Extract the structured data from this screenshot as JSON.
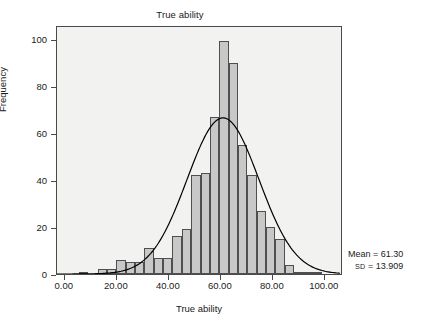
{
  "chart_data": {
    "type": "bar",
    "title": "True ability",
    "xlabel": "True ability",
    "ylabel": "Frequency",
    "subtype": "histogram-with-normal-curve",
    "xlim": [
      -3,
      107
    ],
    "ylim": [
      0,
      106
    ],
    "grid": false,
    "legend": null,
    "xticks": [
      0,
      20,
      40,
      60,
      80,
      100
    ],
    "xtick_labels": [
      "0.00",
      "20.00",
      "40.00",
      "60.00",
      "80.00",
      "100.00"
    ],
    "yticks": [
      0,
      20,
      40,
      60,
      80,
      100
    ],
    "ytick_labels": [
      "0",
      "20",
      "40",
      "60",
      "80",
      "100"
    ],
    "bin_width": 3.6,
    "bin_centers": [
      7.2,
      10.8,
      14.4,
      18.0,
      21.6,
      25.2,
      28.8,
      32.4,
      36.0,
      39.6,
      43.2,
      46.8,
      50.4,
      54.0,
      57.6,
      61.2,
      64.8,
      68.4,
      72.0,
      75.6,
      79.2,
      82.8,
      86.4,
      90.0,
      93.6,
      97.2,
      100.8
    ],
    "values": [
      1,
      0,
      2,
      2,
      6,
      5,
      5,
      11,
      7,
      7,
      16,
      19,
      42,
      43,
      67,
      99,
      90,
      55,
      42,
      27,
      20,
      15,
      4,
      1,
      1,
      1,
      0
    ],
    "categories": [
      "7.2",
      "10.8",
      "14.4",
      "18.0",
      "21.6",
      "25.2",
      "28.8",
      "32.4",
      "36.0",
      "39.6",
      "43.2",
      "46.8",
      "50.4",
      "54.0",
      "57.6",
      "61.2",
      "64.8",
      "68.4",
      "72.0",
      "75.6",
      "79.2",
      "82.8",
      "86.4",
      "90.0",
      "93.6",
      "97.2",
      "100.8"
    ],
    "overlay_curve": {
      "type": "normal",
      "mean": 61.3,
      "sd": 13.909,
      "peak_value": 67
    },
    "annotations": {
      "mean_text": "Mean = 61.30",
      "sd_label": "SD",
      "sd_text": " = 13.909",
      "mean": 61.3,
      "sd": 13.909
    },
    "colors": {
      "bar_fill": "#c8c8c8",
      "bar_edge": "#4f4f4f",
      "plot_background": "#f2f2f0",
      "frame": "#4a4a4a",
      "curve": "#000000",
      "text": "#1a1a1a"
    }
  }
}
